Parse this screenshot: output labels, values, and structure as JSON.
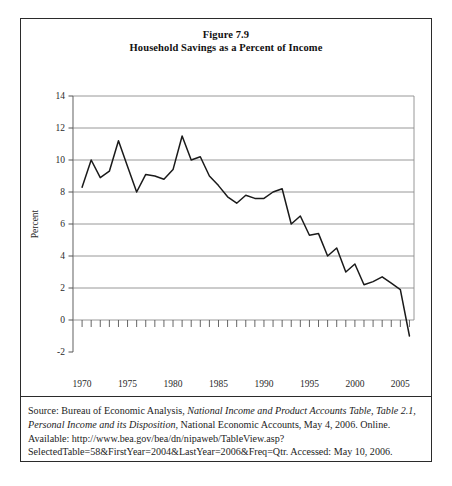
{
  "figure": {
    "title_line1": "Figure 7.9",
    "title_line2": "Household Savings as a Percent of Income"
  },
  "caption": {
    "seg1": "Source: Bureau of Economic Analysis, ",
    "seg2_italic": "National Income and Product Accounts Table, Table 2.1, Personal Income and its Disposition",
    "seg3": ", National Economic Accounts, May 4, 2006. Online. Available: http://www.bea.gov/bea/dn/nipaweb/TableView.asp?SelectedTable=58&FirstYear=2004&LastYear=2006&Freq=Qtr. Accessed: May 10, 2006."
  },
  "chart_data": {
    "type": "line",
    "title": "Household Savings as a Percent of Income",
    "xlabel": "",
    "ylabel": "Percent",
    "xlim": [
      1969.0,
      2006.5
    ],
    "ylim": [
      -2,
      14
    ],
    "yticks": [
      -2,
      0,
      2,
      4,
      6,
      8,
      10,
      12,
      14
    ],
    "ytick_labels": [
      "-2",
      "0",
      "2",
      "4",
      "6",
      "8",
      "10",
      "12",
      "14"
    ],
    "xticks": [
      1970,
      1975,
      1980,
      1985,
      1990,
      1995,
      2000,
      2005
    ],
    "xtick_labels": [
      "1970",
      "1975",
      "1980",
      "1985",
      "1990",
      "1995",
      "2000",
      "2005"
    ],
    "minor_xticks_every": 1,
    "grid": "horizontal",
    "legend": "none",
    "line_color": "#1a1a1a",
    "grid_color": "#8c8c8c",
    "series": [
      {
        "name": "Household savings rate",
        "x": [
          1970,
          1971,
          1972,
          1973,
          1974,
          1975,
          1976,
          1977,
          1978,
          1979,
          1980,
          1981,
          1982,
          1983,
          1984,
          1985,
          1986,
          1987,
          1988,
          1989,
          1990,
          1991,
          1992,
          1993,
          1994,
          1995,
          1996,
          1997,
          1998,
          1999,
          2000,
          2001,
          2002,
          2003,
          2004,
          2005,
          2006
        ],
        "values": [
          8.3,
          10.0,
          8.9,
          9.3,
          11.2,
          9.6,
          8.0,
          9.1,
          9.0,
          8.8,
          9.4,
          11.5,
          10.0,
          10.2,
          9.0,
          8.4,
          7.7,
          7.3,
          7.8,
          7.6,
          7.6,
          8.0,
          8.2,
          6.0,
          6.5,
          5.3,
          5.4,
          4.0,
          4.5,
          3.0,
          3.5,
          2.2,
          2.4,
          2.7,
          2.3,
          1.9,
          -1.0
        ],
        "line_color": "#1a1a1a"
      }
    ]
  }
}
